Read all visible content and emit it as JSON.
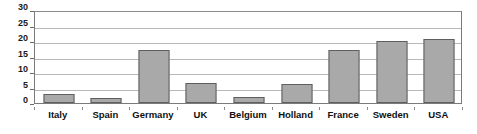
{
  "chart_data": {
    "type": "bar",
    "title": "",
    "subtitle": "",
    "xlabel": "",
    "ylabel": "",
    "categories": [
      "Italy",
      "Spain",
      "Germany",
      "UK",
      "Belgium",
      "Holland",
      "France",
      "Sweden",
      "USA"
    ],
    "values": [
      3,
      1.5,
      17,
      6.5,
      2,
      6,
      17,
      20,
      20.5
    ],
    "ylim": [
      0,
      30
    ],
    "yticks": [
      0,
      5,
      10,
      15,
      20,
      25,
      30
    ],
    "ytick_labels": [
      "0",
      "5",
      "10",
      "15",
      "20",
      "25",
      "30"
    ],
    "grid": true,
    "grid_axis": "y",
    "legend": null,
    "legend_position": "none",
    "bar_color": "#a9a9a9",
    "bar_border_color": "#5f5f5f",
    "grid_color": "#b8b8b8",
    "frame_color": "#7a7a7a",
    "text_color": "#101010"
  }
}
